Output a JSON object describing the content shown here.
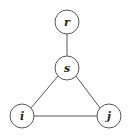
{
  "diagram": {
    "type": "graph",
    "nodes": [
      {
        "id": "r",
        "label": "r",
        "cx": 67,
        "cy": 22,
        "r": 12
      },
      {
        "id": "s",
        "label": "s",
        "cx": 67,
        "cy": 68,
        "r": 12
      },
      {
        "id": "i",
        "label": "i",
        "cx": 22,
        "cy": 116,
        "r": 12
      },
      {
        "id": "j",
        "label": "j",
        "cx": 109,
        "cy": 116,
        "r": 12
      }
    ],
    "edges": [
      {
        "from": "r",
        "to": "s"
      },
      {
        "from": "s",
        "to": "i"
      },
      {
        "from": "s",
        "to": "j"
      },
      {
        "from": "i",
        "to": "j"
      }
    ]
  }
}
